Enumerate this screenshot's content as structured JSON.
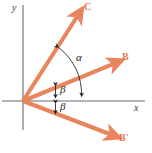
{
  "figure": {
    "background_color": "#ffffff",
    "vector_color": "#e8855c",
    "axis_color": "#6b6b6b",
    "angle_mark_color": "#1c1c1c",
    "label_color_vector": "#e07a52",
    "label_color_axis": "#3a3a3a"
  },
  "axes": {
    "x_label": "x",
    "y_label": "y",
    "origin": {
      "x": 23,
      "y": 101
    },
    "x_axis": {
      "x1": 2,
      "y1": 101,
      "x2": 145,
      "y2": 101
    },
    "y_axis": {
      "x1": 23,
      "y1": 5,
      "x2": 23,
      "y2": 130
    }
  },
  "vectors": [
    {
      "name": "C",
      "label": "C",
      "from": {
        "x": 23,
        "y": 101
      },
      "to": {
        "x": 80,
        "y": 12
      },
      "angle_deg": 57.4,
      "label_pos": {
        "x": 84,
        "y": 2
      }
    },
    {
      "name": "B",
      "label": "B",
      "from": {
        "x": 23,
        "y": 101
      },
      "to": {
        "x": 118,
        "y": 62
      },
      "angle_deg": 24.1,
      "label_pos": {
        "x": 122,
        "y": 52
      }
    },
    {
      "name": "B-prime",
      "label": "B'",
      "from": {
        "x": 23,
        "y": 101
      },
      "to": {
        "x": 115,
        "y": 136
      },
      "angle_deg": -20.8,
      "label_pos": {
        "x": 119,
        "y": 133
      }
    }
  ],
  "angles": [
    {
      "name": "alpha",
      "label": "α",
      "description": "arc from vector C down to the positive x-axis",
      "label_pos": {
        "x": 76,
        "y": 52
      }
    },
    {
      "name": "beta-upper",
      "label": "β",
      "description": "double-headed arrow between vector C and vector B",
      "label_pos": {
        "x": 60,
        "y": 84
      }
    },
    {
      "name": "beta-lower",
      "label": "β",
      "description": "double-headed arrow between vector B and the x-axis",
      "label_pos": {
        "x": 60,
        "y": 101
      }
    }
  ]
}
